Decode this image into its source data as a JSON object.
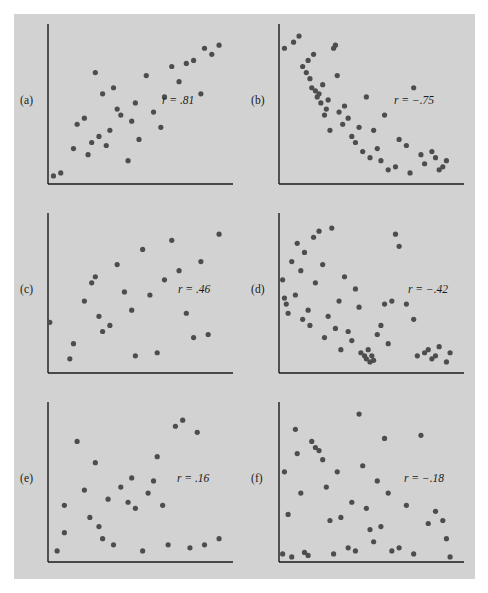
{
  "figure": {
    "background_color": "#d2d2d2",
    "page_color": "#ffffff",
    "axis_color": "#1a1a1a",
    "point_color": "#4d4d4d",
    "point_radius": 2.6,
    "panel_letters": [
      "(a)",
      "(b)",
      "(c)",
      "(d)",
      "(e)",
      "(f)"
    ],
    "r_labels": [
      "r = .81",
      "r = −.75",
      "r = .46",
      "r = −.42",
      "r = .16",
      "r = −.18"
    ]
  },
  "chart_data": [
    {
      "type": "scatter",
      "panel": "(a)",
      "label": "r = .81",
      "r": 0.81,
      "title": "",
      "xlabel": "",
      "ylabel": "",
      "xlim": [
        0,
        100
      ],
      "ylim": [
        0,
        100
      ],
      "grid": false,
      "legend": "none",
      "x": [
        3,
        7,
        14,
        16,
        20,
        22,
        24,
        26,
        28,
        30,
        32,
        34,
        36,
        38,
        40,
        44,
        46,
        48,
        50,
        54,
        58,
        62,
        64,
        68,
        72,
        76,
        80,
        84,
        86,
        90,
        94
      ],
      "y": [
        4,
        6,
        22,
        38,
        42,
        18,
        26,
        72,
        30,
        58,
        24,
        34,
        62,
        48,
        44,
        14,
        40,
        52,
        28,
        70,
        46,
        36,
        56,
        76,
        66,
        78,
        80,
        58,
        88,
        84,
        90
      ]
    },
    {
      "type": "scatter",
      "panel": "(b)",
      "label": "r = −.75",
      "r": -0.75,
      "title": "",
      "xlabel": "",
      "ylabel": "",
      "xlim": [
        0,
        100
      ],
      "ylim": [
        0,
        100
      ],
      "grid": false,
      "legend": "none",
      "x": [
        3,
        8,
        11,
        13,
        15,
        16,
        17,
        18,
        19,
        20,
        21,
        22,
        23,
        24,
        25,
        26,
        27,
        28,
        30,
        31,
        32,
        33,
        35,
        36,
        38,
        40,
        42,
        44,
        46,
        48,
        50,
        52,
        54,
        56,
        58,
        60,
        64,
        66,
        70,
        72,
        74,
        78,
        80,
        84,
        86,
        88,
        90,
        92
      ],
      "y": [
        88,
        92,
        96,
        76,
        72,
        80,
        68,
        62,
        84,
        60,
        56,
        58,
        52,
        64,
        44,
        48,
        54,
        34,
        88,
        90,
        70,
        46,
        38,
        50,
        42,
        30,
        26,
        36,
        20,
        56,
        16,
        34,
        22,
        14,
        44,
        8,
        10,
        28,
        24,
        6,
        62,
        18,
        12,
        20,
        16,
        8,
        10,
        14
      ]
    },
    {
      "type": "scatter",
      "panel": "(c)",
      "label": "r = .46",
      "r": 0.46,
      "title": "",
      "xlabel": "",
      "ylabel": "",
      "xlim": [
        0,
        100
      ],
      "ylim": [
        0,
        100
      ],
      "grid": false,
      "legend": "none",
      "x": [
        1,
        12,
        14,
        20,
        24,
        26,
        28,
        30,
        34,
        38,
        42,
        46,
        48,
        52,
        56,
        60,
        64,
        68,
        72,
        76,
        80,
        84,
        88,
        94
      ],
      "y": [
        32,
        8,
        18,
        46,
        58,
        62,
        36,
        26,
        30,
        70,
        52,
        40,
        10,
        80,
        50,
        12,
        60,
        86,
        66,
        38,
        22,
        72,
        24,
        90
      ]
    },
    {
      "type": "scatter",
      "panel": "(d)",
      "label": "r = −.42",
      "r": -0.42,
      "title": "",
      "xlabel": "",
      "ylabel": "",
      "xlim": [
        0,
        100
      ],
      "ylim": [
        0,
        100
      ],
      "grid": false,
      "legend": "none",
      "x": [
        2,
        3,
        4,
        5,
        7,
        9,
        10,
        12,
        13,
        14,
        16,
        17,
        19,
        20,
        22,
        24,
        25,
        27,
        29,
        31,
        33,
        34,
        36,
        38,
        40,
        42,
        44,
        45,
        47,
        48,
        49,
        50,
        51,
        52,
        54,
        56,
        58,
        60,
        62,
        64,
        66,
        70,
        74,
        76,
        80,
        82,
        84,
        86,
        88,
        92,
        94
      ],
      "y": [
        60,
        48,
        44,
        38,
        72,
        50,
        84,
        66,
        34,
        78,
        40,
        30,
        88,
        58,
        92,
        70,
        22,
        36,
        94,
        28,
        46,
        14,
        62,
        26,
        20,
        54,
        42,
        12,
        10,
        8,
        14,
        6,
        10,
        7,
        24,
        30,
        44,
        18,
        46,
        90,
        82,
        44,
        34,
        10,
        12,
        14,
        8,
        10,
        16,
        6,
        12
      ]
    },
    {
      "type": "scatter",
      "panel": "(e)",
      "label": "r = .16",
      "r": 0.16,
      "title": "",
      "xlabel": "",
      "ylabel": "",
      "xlim": [
        0,
        100
      ],
      "ylim": [
        0,
        100
      ],
      "grid": false,
      "legend": "none",
      "x": [
        5,
        9,
        9,
        16,
        20,
        23,
        26,
        28,
        30,
        33,
        36,
        40,
        44,
        46,
        48,
        52,
        55,
        58,
        60,
        63,
        66,
        70,
        74,
        78,
        82,
        86,
        94
      ],
      "y": [
        6,
        36,
        18,
        78,
        46,
        28,
        64,
        22,
        14,
        40,
        10,
        48,
        38,
        54,
        34,
        6,
        44,
        52,
        68,
        36,
        10,
        88,
        92,
        8,
        84,
        10,
        14
      ]
    },
    {
      "type": "scatter",
      "panel": "(f)",
      "label": "r = −.18",
      "r": -0.18,
      "title": "",
      "xlabel": "",
      "ylabel": "",
      "xlim": [
        0,
        100
      ],
      "ylim": [
        0,
        100
      ],
      "grid": false,
      "legend": "none",
      "x": [
        2,
        3,
        5,
        7,
        9,
        10,
        12,
        14,
        16,
        18,
        20,
        22,
        24,
        26,
        28,
        30,
        32,
        34,
        38,
        40,
        42,
        44,
        46,
        48,
        50,
        52,
        54,
        56,
        58,
        60,
        62,
        66,
        70,
        74,
        78,
        82,
        86,
        90,
        92,
        94
      ],
      "y": [
        4,
        58,
        30,
        2,
        86,
        70,
        44,
        5,
        3,
        78,
        74,
        72,
        66,
        48,
        26,
        4,
        58,
        28,
        8,
        38,
        6,
        96,
        62,
        34,
        20,
        12,
        52,
        22,
        80,
        44,
        6,
        8,
        36,
        4,
        82,
        24,
        32,
        26,
        14,
        2
      ]
    }
  ]
}
